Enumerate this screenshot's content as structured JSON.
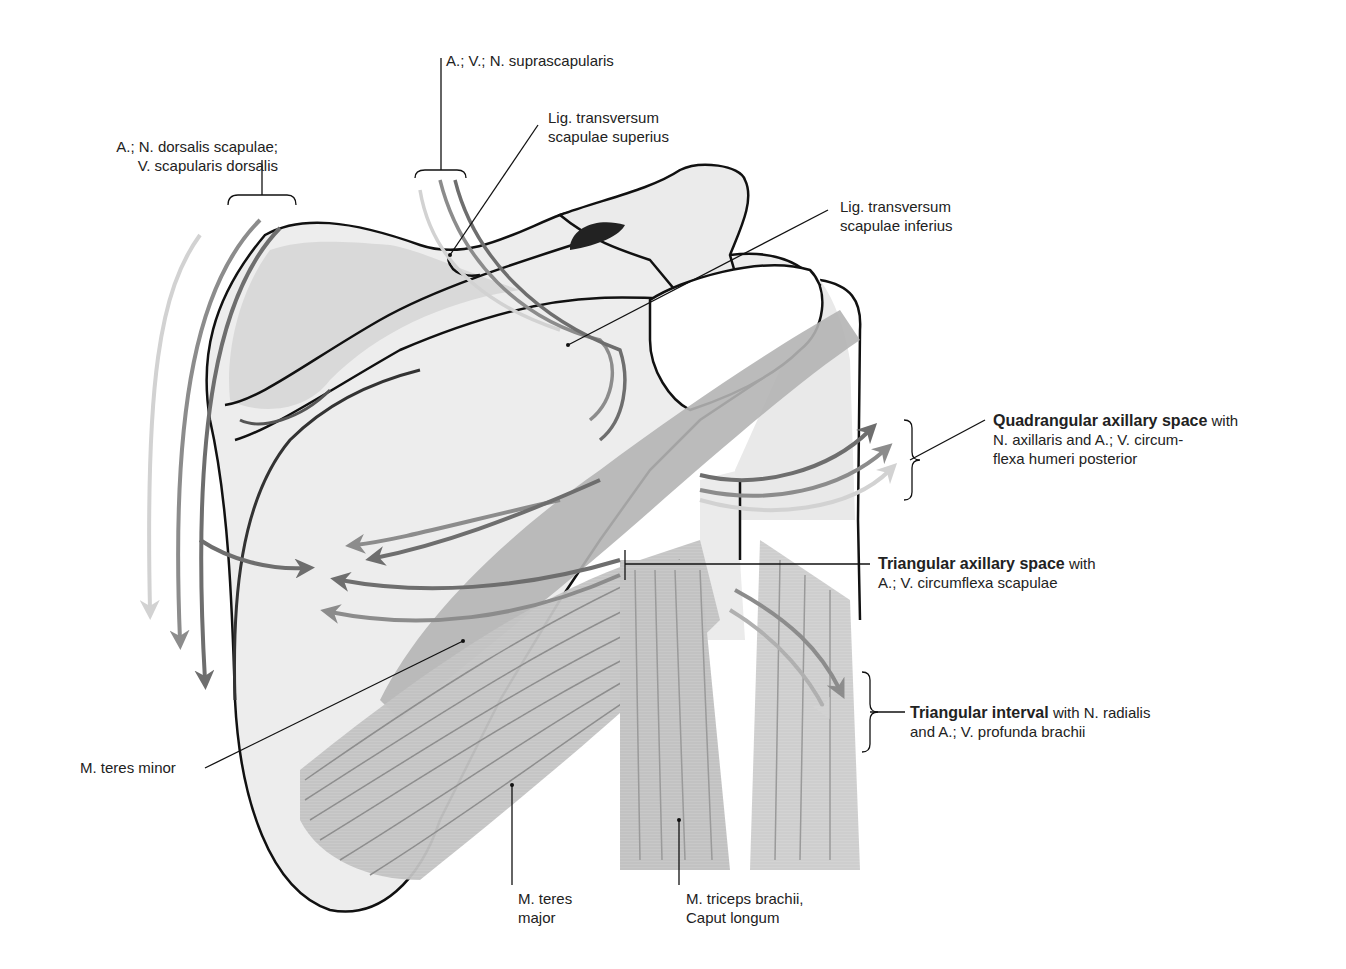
{
  "figure": {
    "colors": {
      "bone_fill": "#ececec",
      "bone_shade": "#d4d4d4",
      "outline": "#111111",
      "muscle_fill": "#c6c6c6",
      "muscle_dark": "#a9a9a9",
      "fiber": "#8e8e8e",
      "arrow_dark": "#6e6e6e",
      "arrow_mid": "#8c8c8c",
      "arrow_light": "#d0d0d0"
    }
  },
  "labels": {
    "suprascapularis": "A.; V.; N. suprascapularis",
    "lig_sup_line1": "Lig. transversum",
    "lig_sup_line2": "scapulae superius",
    "dorsalis_line1": "A.; N. dorsalis scapulae;",
    "dorsalis_line2": "V. scapularis dorsalis",
    "lig_inf_line1": "Lig. transversum",
    "lig_inf_line2": "scapulae inferius",
    "quad_bold": "Quadrangular axillary space",
    "quad_with": " with",
    "quad_line2": "N. axillaris and A.; V. circum-",
    "quad_line3": "flexa humeri posterior",
    "tri_space_bold": "Triangular axillary space",
    "tri_space_with": " with",
    "tri_space_line2": "A.; V. circumflexa scapulae",
    "tri_interval_bold": "Triangular interval",
    "tri_interval_rest": " with N. radialis",
    "tri_interval_line2": "and A.; V. profunda brachii",
    "teres_minor": "M. teres minor",
    "teres_major_line1": "M. teres",
    "teres_major_line2": "major",
    "triceps_line1": "M. triceps brachii,",
    "triceps_line2": "Caput longum"
  }
}
